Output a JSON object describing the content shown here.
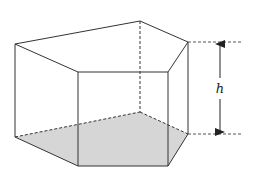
{
  "figure": {
    "height_label": "h",
    "colors": {
      "edge": "#333333",
      "base_fill": "#d6d6d6",
      "background": "#ffffff"
    },
    "top_face": [
      [
        15,
        44
      ],
      [
        140,
        21
      ],
      [
        188,
        42
      ],
      [
        168,
        72
      ],
      [
        78,
        72
      ]
    ],
    "bottom_face": [
      [
        15,
        137
      ],
      [
        140,
        112
      ],
      [
        188,
        134
      ],
      [
        168,
        166
      ],
      [
        78,
        166
      ]
    ],
    "hidden_edges": [
      [
        [
          140,
          21
        ],
        [
          140,
          112
        ]
      ],
      [
        [
          15,
          137
        ],
        [
          140,
          112
        ]
      ],
      [
        [
          140,
          112
        ],
        [
          188,
          134
        ]
      ]
    ],
    "height_guides": {
      "top_y": 42,
      "bottom_y": 134,
      "x_start": 188,
      "x_end": 243,
      "arrow_x": 220
    }
  }
}
